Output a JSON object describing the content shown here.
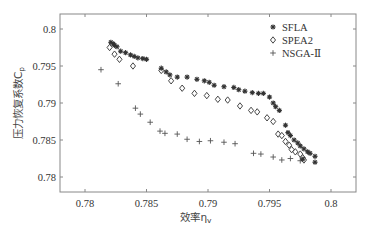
{
  "chart_data": {
    "type": "scatter",
    "title": "",
    "xlabel": "效率η",
    "xlabel_sub": "v",
    "ylabel": "压力恢复系数C",
    "ylabel_sub": "p",
    "xlim": [
      0.778,
      0.802
    ],
    "ylim": [
      0.778,
      0.802
    ],
    "xticks": [
      0.78,
      0.785,
      0.79,
      0.795,
      0.8
    ],
    "xtick_labels": [
      "0.78",
      "0.785",
      "0.79",
      "0.795",
      "0.8"
    ],
    "yticks": [
      0.78,
      0.785,
      0.79,
      0.795,
      0.8
    ],
    "ytick_labels": [
      "0.78",
      "0.785",
      "0.79",
      "0.795",
      "0.8"
    ],
    "grid": false,
    "legend_position": "top-right",
    "series": [
      {
        "name": "SFLA",
        "marker": "star",
        "color": "#333333",
        "points": [
          [
            0.7821,
            0.7982
          ],
          [
            0.7823,
            0.798
          ],
          [
            0.7824,
            0.7978
          ],
          [
            0.7826,
            0.7976
          ],
          [
            0.7829,
            0.797
          ],
          [
            0.7833,
            0.7968
          ],
          [
            0.7837,
            0.7965
          ],
          [
            0.784,
            0.7963
          ],
          [
            0.7843,
            0.7961
          ],
          [
            0.7847,
            0.796
          ],
          [
            0.785,
            0.7959
          ],
          [
            0.7862,
            0.7947
          ],
          [
            0.7866,
            0.7942
          ],
          [
            0.7869,
            0.7938
          ],
          [
            0.7875,
            0.7935
          ],
          [
            0.7883,
            0.7935
          ],
          [
            0.7891,
            0.7932
          ],
          [
            0.7897,
            0.793
          ],
          [
            0.7901,
            0.7928
          ],
          [
            0.7905,
            0.7924
          ],
          [
            0.7913,
            0.7922
          ],
          [
            0.7921,
            0.7921
          ],
          [
            0.7925,
            0.7918
          ],
          [
            0.793,
            0.7916
          ],
          [
            0.7936,
            0.7914
          ],
          [
            0.7941,
            0.7913
          ],
          [
            0.7945,
            0.7913
          ],
          [
            0.795,
            0.7908
          ],
          [
            0.7953,
            0.79
          ],
          [
            0.7955,
            0.7895
          ],
          [
            0.7958,
            0.789
          ],
          [
            0.7963,
            0.787
          ],
          [
            0.7965,
            0.786
          ],
          [
            0.7967,
            0.7856
          ],
          [
            0.797,
            0.785
          ],
          [
            0.7973,
            0.7846
          ],
          [
            0.7975,
            0.7842
          ],
          [
            0.7978,
            0.7838
          ],
          [
            0.7981,
            0.7834
          ],
          [
            0.7983,
            0.7832
          ],
          [
            0.7987,
            0.7828
          ],
          [
            0.7977,
            0.7824
          ],
          [
            0.7987,
            0.782
          ]
        ]
      },
      {
        "name": "SPEA2",
        "marker": "diamond",
        "color": "#333333",
        "points": [
          [
            0.782,
            0.7975
          ],
          [
            0.7824,
            0.7966
          ],
          [
            0.7828,
            0.7959
          ],
          [
            0.7839,
            0.795
          ],
          [
            0.7862,
            0.7944
          ],
          [
            0.787,
            0.793
          ],
          [
            0.7879,
            0.792
          ],
          [
            0.7889,
            0.7913
          ],
          [
            0.7899,
            0.791
          ],
          [
            0.7908,
            0.7905
          ],
          [
            0.7916,
            0.7904
          ],
          [
            0.7926,
            0.7896
          ],
          [
            0.7935,
            0.789
          ],
          [
            0.794,
            0.7888
          ],
          [
            0.7948,
            0.788
          ],
          [
            0.7953,
            0.7875
          ],
          [
            0.7957,
            0.7858
          ],
          [
            0.796,
            0.7856
          ],
          [
            0.7963,
            0.7848
          ],
          [
            0.7966,
            0.7843
          ],
          [
            0.7968,
            0.7837
          ],
          [
            0.7971,
            0.7834
          ],
          [
            0.7975,
            0.7831
          ],
          [
            0.7977,
            0.7826
          ],
          [
            0.7978,
            0.7823
          ]
        ]
      },
      {
        "name": "NSGA-Ⅱ",
        "marker": "plus",
        "color": "#555555",
        "points": [
          [
            0.7813,
            0.7945
          ],
          [
            0.7827,
            0.7926
          ],
          [
            0.7841,
            0.7893
          ],
          [
            0.7845,
            0.7885
          ],
          [
            0.7853,
            0.7874
          ],
          [
            0.7861,
            0.7862
          ],
          [
            0.7865,
            0.7859
          ],
          [
            0.7875,
            0.7858
          ],
          [
            0.7883,
            0.7851
          ],
          [
            0.7893,
            0.7848
          ],
          [
            0.7902,
            0.7849
          ],
          [
            0.7913,
            0.7847
          ],
          [
            0.7922,
            0.7845
          ],
          [
            0.7937,
            0.7832
          ],
          [
            0.7943,
            0.7831
          ],
          [
            0.7953,
            0.7827
          ],
          [
            0.796,
            0.7823
          ],
          [
            0.7967,
            0.7825
          ],
          [
            0.7975,
            0.7822
          ]
        ]
      }
    ]
  }
}
